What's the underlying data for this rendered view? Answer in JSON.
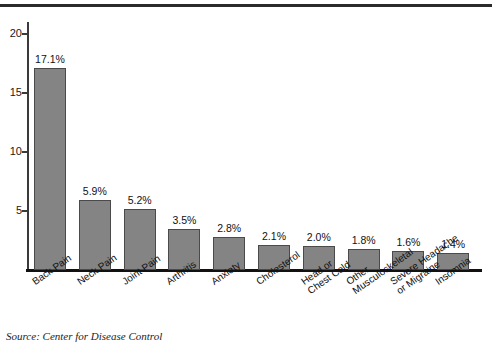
{
  "chart_data": {
    "type": "bar",
    "title": "",
    "xlabel": "",
    "ylabel": "",
    "ylim": [
      0,
      21
    ],
    "grid": false,
    "legend": "none",
    "yticks": [
      5,
      10,
      15,
      20
    ],
    "ytick_labels": [
      "5",
      "10",
      "15",
      "20"
    ],
    "categories": [
      "Back Pain",
      "Neck Pain",
      "Joint Pain",
      "Arthritis",
      "Anxiety",
      "Cholesterol",
      "Head or Chest Cold",
      "Other Musculoskeletal",
      "Severe Headache or Migraine",
      "Insomnia"
    ],
    "category_lines": [
      [
        "Back Pain",
        ""
      ],
      [
        "Neck Pain",
        ""
      ],
      [
        "Joint Pain",
        ""
      ],
      [
        "Arthritis",
        ""
      ],
      [
        "Anxiety",
        ""
      ],
      [
        "Cholesterol",
        ""
      ],
      [
        "Head or",
        "Chest Cold"
      ],
      [
        "Other",
        "Musculoskeletal"
      ],
      [
        "Severe Headache",
        "or Migraine"
      ],
      [
        "Insomnia",
        ""
      ]
    ],
    "values": [
      17.1,
      5.9,
      5.2,
      3.5,
      2.8,
      2.1,
      2.0,
      1.8,
      1.6,
      1.4
    ],
    "value_labels": [
      "17.1%",
      "5.9%",
      "5.2%",
      "3.5%",
      "2.8%",
      "2.1%",
      "2.0%",
      "1.8%",
      "1.6%",
      "1.4%"
    ],
    "bar_color": "#848484",
    "bar_edge_color": "#4a4a4a",
    "axis_color": "#111111",
    "background": "#ffffff"
  },
  "caption": {
    "source": "Source: Center for Disease Control"
  }
}
